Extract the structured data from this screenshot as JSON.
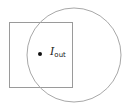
{
  "diagram": {
    "square": {
      "x": 9,
      "y": 22,
      "width": 63,
      "height": 65,
      "stroke": "#9a9a9a"
    },
    "circle": {
      "cx": 74,
      "cy": 55,
      "r": 47,
      "stroke": "#a8a8a8"
    },
    "point": {
      "cx": 40,
      "cy": 54,
      "r": 2,
      "fill": "#111111"
    },
    "label": {
      "main": "I",
      "subscript": "out"
    }
  }
}
